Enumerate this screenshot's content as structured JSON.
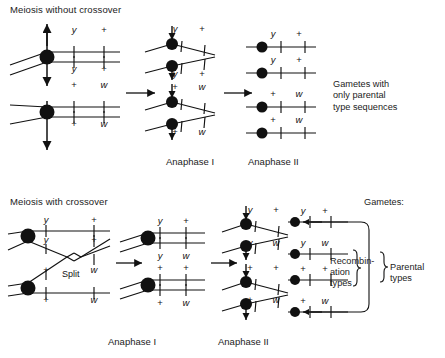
{
  "figure": {
    "width": 445,
    "height": 358,
    "background": "#ffffff",
    "ink": "#111111"
  },
  "panels": [
    {
      "id": "without-crossover",
      "title": "Meiosis without crossover",
      "stage_labels": [
        {
          "text": "Anaphase I",
          "x": 166,
          "y": 156
        },
        {
          "text": "Anaphase II",
          "x": 248,
          "y": 156
        }
      ],
      "note": {
        "text": "Gametes with\nonly parental\ntype sequences",
        "x": 333,
        "y": 79
      },
      "groups": [
        {
          "id": "prophase-top",
          "stage": "prophase",
          "alleles": [
            {
              "label": "y",
              "italic": true,
              "x": 74,
              "y": 30
            },
            {
              "label": "+",
              "italic": false,
              "x": 104,
              "y": 30
            },
            {
              "label": "y",
              "italic": true,
              "x": 74,
              "y": 69
            },
            {
              "label": "+",
              "italic": false,
              "x": 104,
              "y": 69
            }
          ]
        },
        {
          "id": "prophase-bottom",
          "stage": "prophase",
          "alleles": [
            {
              "label": "+",
              "italic": false,
              "x": 74,
              "y": 85
            },
            {
              "label": "w",
              "italic": true,
              "x": 104,
              "y": 85
            },
            {
              "label": "+",
              "italic": false,
              "x": 74,
              "y": 124
            },
            {
              "label": "w",
              "italic": true,
              "x": 104,
              "y": 124
            }
          ]
        },
        {
          "id": "anaphase1-1",
          "stage": "anaphase-i",
          "alleles": [
            {
              "label": "y",
              "italic": true,
              "x": 175,
              "y": 29
            },
            {
              "label": "+",
              "italic": false,
              "x": 202,
              "y": 29
            }
          ]
        },
        {
          "id": "anaphase1-2",
          "stage": "anaphase-i",
          "alleles": [
            {
              "label": "y",
              "italic": true,
              "x": 175,
              "y": 74
            },
            {
              "label": "+",
              "italic": false,
              "x": 202,
              "y": 74
            }
          ]
        },
        {
          "id": "anaphase1-3",
          "stage": "anaphase-i",
          "alleles": [
            {
              "label": "+",
              "italic": false,
              "x": 175,
              "y": 87
            },
            {
              "label": "w",
              "italic": true,
              "x": 202,
              "y": 87
            }
          ]
        },
        {
          "id": "anaphase1-4",
          "stage": "anaphase-i",
          "alleles": [
            {
              "label": "+",
              "italic": false,
              "x": 175,
              "y": 132
            },
            {
              "label": "w",
              "italic": true,
              "x": 202,
              "y": 132
            }
          ]
        },
        {
          "id": "anaphase2-1",
          "stage": "anaphase-ii",
          "alleles": [
            {
              "label": "y",
              "italic": true,
              "x": 273,
              "y": 34
            },
            {
              "label": "+",
              "italic": false,
              "x": 299,
              "y": 34
            }
          ]
        },
        {
          "id": "anaphase2-2",
          "stage": "anaphase-ii",
          "alleles": [
            {
              "label": "y",
              "italic": true,
              "x": 273,
              "y": 60
            },
            {
              "label": "+",
              "italic": false,
              "x": 299,
              "y": 60
            }
          ]
        },
        {
          "id": "anaphase2-3",
          "stage": "anaphase-ii",
          "alleles": [
            {
              "label": "+",
              "italic": false,
              "x": 273,
              "y": 94
            },
            {
              "label": "w",
              "italic": true,
              "x": 299,
              "y": 94
            }
          ]
        },
        {
          "id": "anaphase2-4",
          "stage": "anaphase-ii",
          "alleles": [
            {
              "label": "+",
              "italic": false,
              "x": 273,
              "y": 120
            },
            {
              "label": "w",
              "italic": true,
              "x": 299,
              "y": 120
            }
          ]
        }
      ]
    },
    {
      "id": "with-crossover",
      "title": "Meiosis with crossover",
      "split_label": {
        "text": "Split",
        "x": 62,
        "y": 275
      },
      "stage_labels": [
        {
          "text": "Anaphase I",
          "x": 108,
          "y": 336
        },
        {
          "text": "Anaphase II",
          "x": 218,
          "y": 336
        }
      ],
      "gametes_head": {
        "text": "Gametes:",
        "x": 364,
        "y": 203
      },
      "brace_labels": [
        {
          "text": "Recombin-\nation\ntypes",
          "x": 330,
          "y": 262
        },
        {
          "text": "Parental\ntypes",
          "x": 390,
          "y": 268
        }
      ],
      "groups": [
        {
          "id": "cross-prophase",
          "stage": "prophase-crossover",
          "alleles": [
            {
              "label": "y",
              "italic": true,
              "x": 46,
              "y": 220
            },
            {
              "label": "+",
              "italic": false,
              "x": 94,
              "y": 220
            },
            {
              "label": "y",
              "italic": true,
              "x": 46,
              "y": 240
            },
            {
              "label": "+",
              "italic": false,
              "x": 94,
              "y": 240
            },
            {
              "label": "+",
              "italic": false,
              "x": 46,
              "y": 270
            },
            {
              "label": "w",
              "italic": true,
              "x": 94,
              "y": 270
            },
            {
              "label": "+",
              "italic": false,
              "x": 46,
              "y": 300
            },
            {
              "label": "w",
              "italic": true,
              "x": 94,
              "y": 300
            }
          ]
        },
        {
          "id": "cross-anaphase1-top",
          "stage": "anaphase-i",
          "alleles": [
            {
              "label": "y",
              "italic": true,
              "x": 160,
              "y": 221
            },
            {
              "label": "+",
              "italic": false,
              "x": 186,
              "y": 221
            },
            {
              "label": "y",
              "italic": true,
              "x": 160,
              "y": 256
            },
            {
              "label": "w",
              "italic": true,
              "x": 186,
              "y": 256
            }
          ]
        },
        {
          "id": "cross-anaphase1-bottom",
          "stage": "anaphase-i",
          "alleles": [
            {
              "label": "+",
              "italic": false,
              "x": 160,
              "y": 268
            },
            {
              "label": "+",
              "italic": false,
              "x": 186,
              "y": 268
            },
            {
              "label": "+",
              "italic": false,
              "x": 160,
              "y": 303
            },
            {
              "label": "w",
              "italic": true,
              "x": 186,
              "y": 303
            }
          ]
        },
        {
          "id": "cross-anaphase2-1",
          "stage": "anaphase-ii",
          "alleles": [
            {
              "label": "y",
              "italic": true,
              "x": 250,
              "y": 210
            },
            {
              "label": "+",
              "italic": false,
              "x": 276,
              "y": 210
            }
          ]
        },
        {
          "id": "cross-anaphase2-2",
          "stage": "anaphase-ii",
          "alleles": [
            {
              "label": "y",
              "italic": true,
              "x": 250,
              "y": 243
            },
            {
              "label": "w",
              "italic": true,
              "x": 276,
              "y": 243
            }
          ]
        },
        {
          "id": "cross-anaphase2-3",
          "stage": "anaphase-ii",
          "alleles": [
            {
              "label": "+",
              "italic": false,
              "x": 250,
              "y": 268
            },
            {
              "label": "+",
              "italic": false,
              "x": 276,
              "y": 268
            }
          ]
        },
        {
          "id": "cross-anaphase2-4",
          "stage": "anaphase-ii",
          "alleles": [
            {
              "label": "+",
              "italic": false,
              "x": 250,
              "y": 300
            },
            {
              "label": "w",
              "italic": true,
              "x": 276,
              "y": 300
            }
          ]
        },
        {
          "id": "gamete-1",
          "stage": "gamete",
          "alleles": [
            {
              "label": "y",
              "italic": true,
              "x": 303,
              "y": 211
            },
            {
              "label": "+",
              "italic": false,
              "x": 325,
              "y": 211
            }
          ]
        },
        {
          "id": "gamete-2",
          "stage": "gamete",
          "alleles": [
            {
              "label": "y",
              "italic": true,
              "x": 303,
              "y": 243
            },
            {
              "label": "w",
              "italic": true,
              "x": 325,
              "y": 243
            }
          ]
        },
        {
          "id": "gamete-3",
          "stage": "gamete",
          "alleles": [
            {
              "label": "+",
              "italic": false,
              "x": 303,
              "y": 269
            },
            {
              "label": "+",
              "italic": false,
              "x": 325,
              "y": 269
            }
          ]
        },
        {
          "id": "gamete-4",
          "stage": "gamete",
          "alleles": [
            {
              "label": "+",
              "italic": false,
              "x": 303,
              "y": 301
            },
            {
              "label": "w",
              "italic": true,
              "x": 325,
              "y": 301
            }
          ]
        }
      ]
    }
  ]
}
